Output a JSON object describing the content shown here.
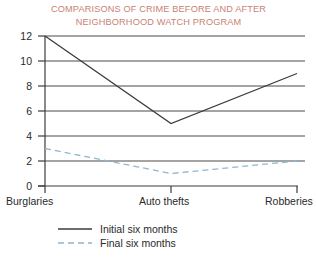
{
  "chart_data": {
    "type": "line",
    "title": "COMPARISONS OF CRIME BEFORE AND AFTER NEIGHBORHOOD WATCH PROGRAM",
    "title_lines": [
      "COMPARISONS OF CRIME BEFORE AND AFTER",
      "NEIGHBORHOOD WATCH PROGRAM"
    ],
    "categories": [
      "Burglaries",
      "Auto thefts",
      "Robberies"
    ],
    "series": [
      {
        "name": "Initial six months",
        "values": [
          12,
          5,
          9
        ],
        "style": "solid",
        "color": "#3b3b3b"
      },
      {
        "name": "Final six months",
        "values": [
          3,
          1,
          2
        ],
        "style": "dashed",
        "color": "#8fb7cf"
      }
    ],
    "xlabel": "",
    "ylabel": "",
    "ylim": [
      0,
      12
    ],
    "yticks": [
      0,
      2,
      4,
      6,
      8,
      10,
      12
    ],
    "ytick_labels": [
      "0",
      "2",
      "4",
      "6",
      "8",
      "10",
      "12"
    ],
    "grid": true,
    "grid_axis": "y",
    "legend_position": "bottom"
  },
  "colors": {
    "title": "#c97f74",
    "axis": "#3b3b3b",
    "grid": "#4a4a4a",
    "initial_series": "#3b3b3b",
    "final_series": "#8fb7cf",
    "background": "#ffffff"
  }
}
